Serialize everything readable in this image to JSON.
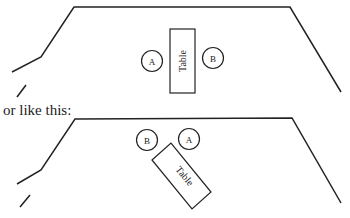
{
  "caption": "or like this:",
  "diagrams": [
    {
      "table_label": "Table",
      "seat_a": "A",
      "seat_b": "B"
    },
    {
      "table_label": "Table",
      "seat_a": "A",
      "seat_b": "B"
    }
  ],
  "colors": {
    "stroke": "#222222",
    "background": "#ffffff"
  }
}
